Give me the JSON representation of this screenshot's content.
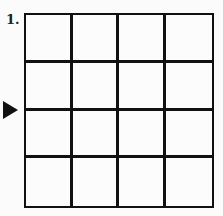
{
  "puzzle": {
    "number_label": "1.",
    "grid": {
      "rows": 4,
      "cols": 4,
      "cells": [
        [
          "",
          "",
          "",
          ""
        ],
        [
          "",
          "",
          "",
          ""
        ],
        [
          "",
          "",
          "",
          ""
        ],
        [
          "",
          "",
          "",
          ""
        ]
      ]
    },
    "arrow": {
      "icon": "triangle-right-icon",
      "points_to_row_boundary": 2
    }
  }
}
